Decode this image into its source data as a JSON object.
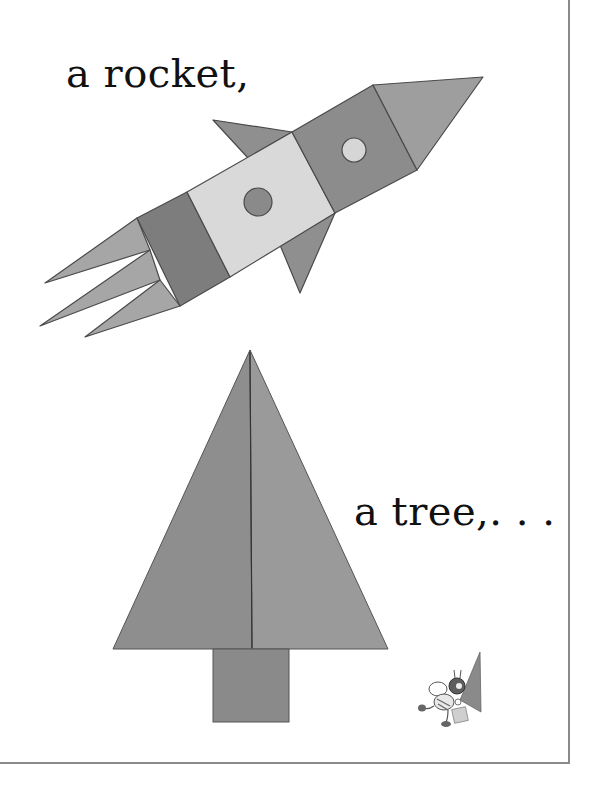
{
  "page": {
    "captions": {
      "rocket": "a rocket,",
      "tree": "a tree,. . ."
    },
    "colors": {
      "background": "#ffffff",
      "frame": "#8a8a8a",
      "text": "#111111",
      "shape_dark": "#8c8c8c",
      "shape_medium": "#a3a3a3",
      "shape_light": "#d9d9d9",
      "shape_textured": "#7d7d7d",
      "outline": "#4a4a4a"
    },
    "illustrations": [
      {
        "name": "rocket",
        "shapes": [
          "nose-triangle",
          "upper-body-square",
          "window-circle-light",
          "middle-body-rectangle",
          "window-circle-dark",
          "rear-body-rectangle",
          "top-fin-triangle",
          "bottom-fin-triangle",
          "flame-triangles"
        ]
      },
      {
        "name": "tree",
        "shapes": [
          "left-half-triangle",
          "right-half-triangle",
          "trunk-rectangle"
        ]
      },
      {
        "name": "bee-character",
        "shapes": [
          "bee",
          "small-triangle",
          "small-square"
        ]
      }
    ]
  }
}
